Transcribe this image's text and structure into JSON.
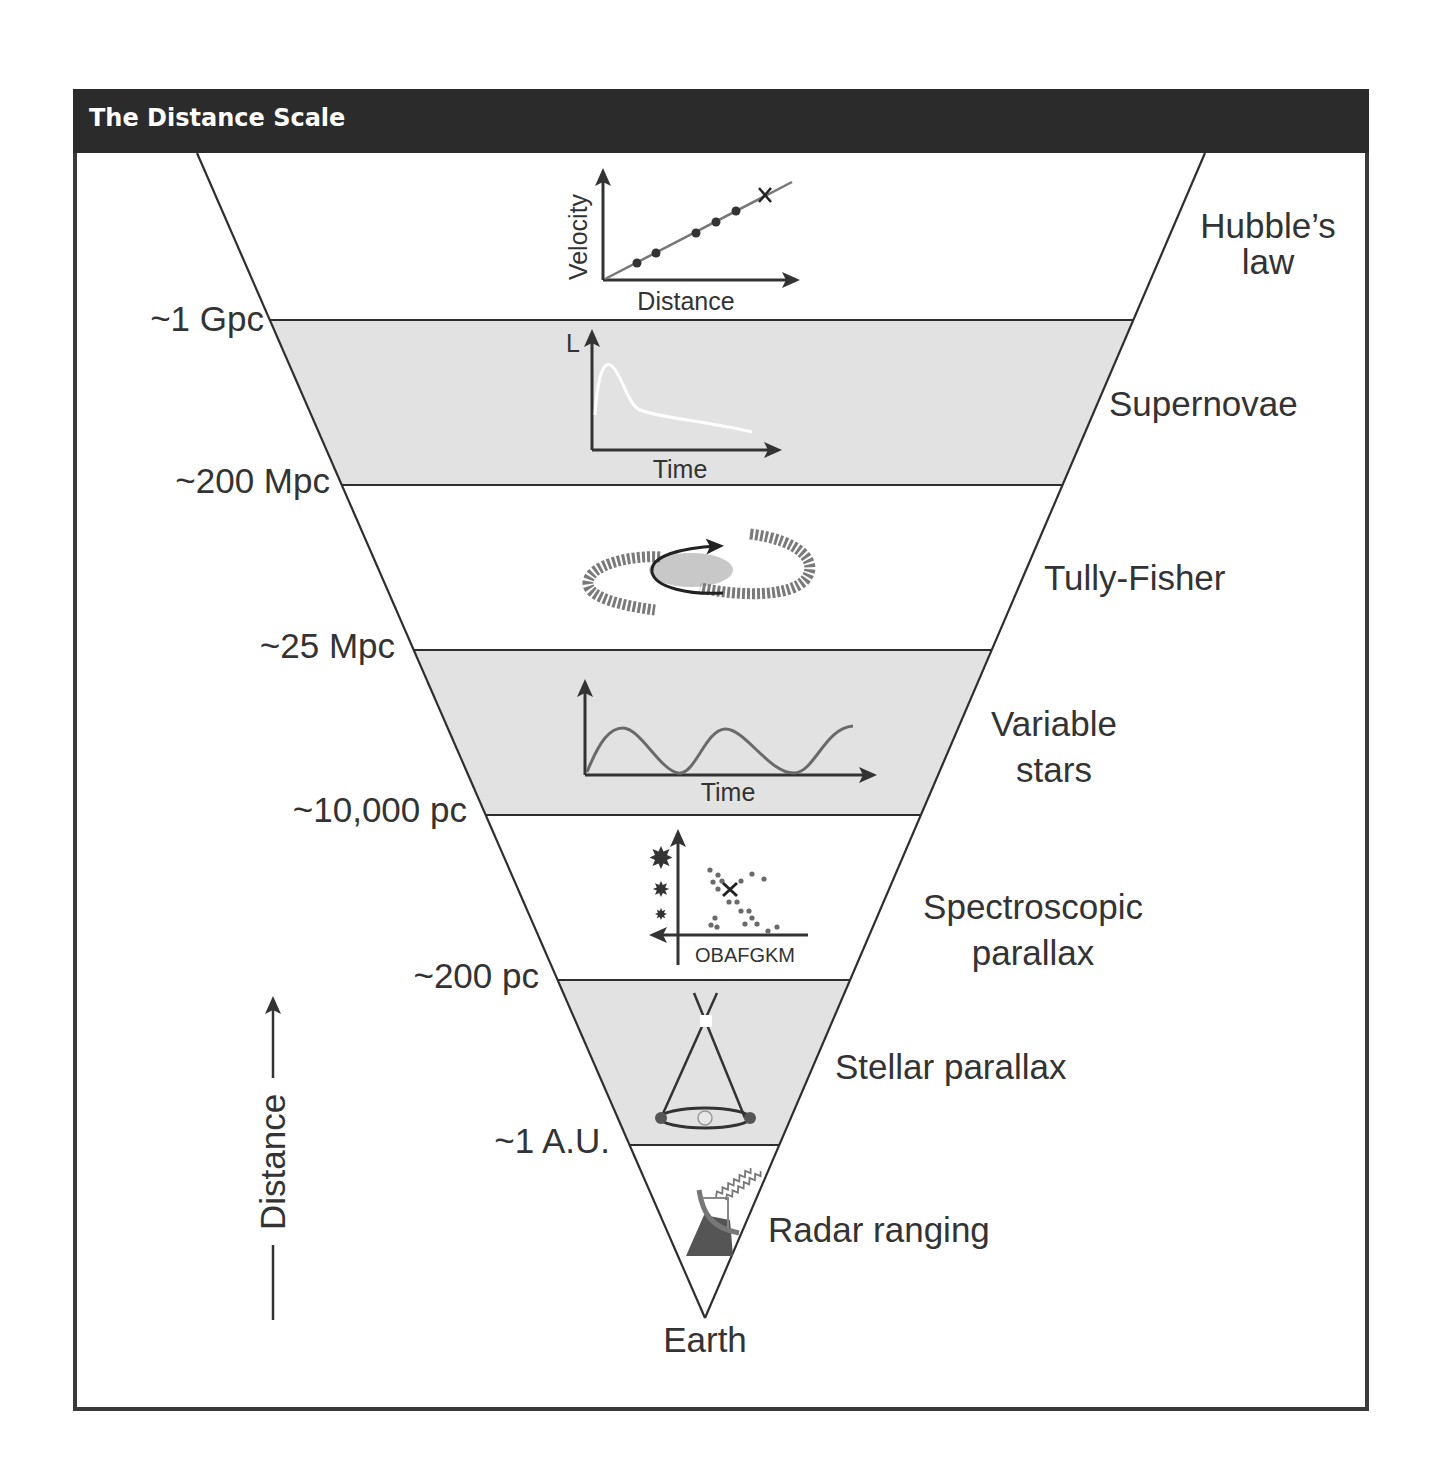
{
  "header": {
    "title": "The Distance Scale"
  },
  "colors": {
    "header_bg": "#2b2b2b",
    "band_shade": "#e2e2e2",
    "line": "#2e2e2e",
    "text": "#333333"
  },
  "boundaries": [
    {
      "label": "~1 Gpc"
    },
    {
      "label": "~200 Mpc"
    },
    {
      "label": "~25 Mpc"
    },
    {
      "label": "~10,000 pc"
    },
    {
      "label": "~200 pc"
    },
    {
      "label": "~1 A.U."
    }
  ],
  "methods": [
    {
      "name_line1": "Hubble’s",
      "name_line2": "law",
      "shaded": false,
      "inset": {
        "type": "line-plot",
        "xlabel": "Distance",
        "ylabel": "Velocity"
      }
    },
    {
      "name_line1": "Supernovae",
      "shaded": true,
      "inset": {
        "type": "light-curve",
        "xlabel": "Time",
        "ylabel": "L"
      }
    },
    {
      "name_line1": "Tully-Fisher",
      "shaded": false,
      "inset": {
        "type": "rotating-spiral-galaxy"
      }
    },
    {
      "name_line1": "Variable",
      "name_line2": "stars",
      "shaded": true,
      "inset": {
        "type": "periodic-curve",
        "xlabel": "Time"
      }
    },
    {
      "name_line1": "Spectroscopic",
      "name_line2": "parallax",
      "shaded": false,
      "inset": {
        "type": "hr-diagram",
        "xlabel": "OBAFGKM"
      }
    },
    {
      "name_line1": "Stellar parallax",
      "shaded": true,
      "inset": {
        "type": "parallax-geometry"
      }
    },
    {
      "name_line1": "Radar ranging",
      "shaded": false,
      "inset": {
        "type": "radar-dish"
      }
    }
  ],
  "apex_label": "Earth",
  "axis": {
    "label": "Distance",
    "direction": "up"
  }
}
